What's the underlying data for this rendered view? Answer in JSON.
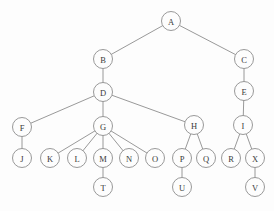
{
  "diagram": {
    "kind": "tree-diagram",
    "title": "",
    "canvas": {
      "width": 274,
      "height": 211
    },
    "style": {
      "background_color": "#fdfdfd",
      "stroke_color": "#8d8d8d",
      "node_fill_color": "#fdfdfd",
      "label_color": "#3a3a3a",
      "node_radius": 9.5,
      "stroke_width": 0.9
    },
    "root": "A",
    "nodes": [
      {
        "id": "A",
        "label": "A",
        "x": 171,
        "y": 21
      },
      {
        "id": "B",
        "label": "B",
        "x": 103,
        "y": 59
      },
      {
        "id": "C",
        "label": "C",
        "x": 244,
        "y": 59
      },
      {
        "id": "D",
        "label": "D",
        "x": 103,
        "y": 92
      },
      {
        "id": "E",
        "label": "E",
        "x": 244,
        "y": 91
      },
      {
        "id": "F",
        "label": "F",
        "x": 22,
        "y": 127
      },
      {
        "id": "G",
        "label": "G",
        "x": 103,
        "y": 126
      },
      {
        "id": "H",
        "label": "H",
        "x": 194,
        "y": 125
      },
      {
        "id": "I",
        "label": "I",
        "x": 243,
        "y": 125
      },
      {
        "id": "J",
        "label": "J",
        "x": 22,
        "y": 158
      },
      {
        "id": "K",
        "label": "K",
        "x": 50,
        "y": 158
      },
      {
        "id": "L",
        "label": "L",
        "x": 77,
        "y": 158
      },
      {
        "id": "M",
        "label": "M",
        "x": 103,
        "y": 158
      },
      {
        "id": "N",
        "label": "N",
        "x": 129,
        "y": 158
      },
      {
        "id": "O",
        "label": "O",
        "x": 155,
        "y": 158
      },
      {
        "id": "P",
        "label": "P",
        "x": 182,
        "y": 158
      },
      {
        "id": "Q",
        "label": "Q",
        "x": 206,
        "y": 158
      },
      {
        "id": "R",
        "label": "R",
        "x": 231,
        "y": 158
      },
      {
        "id": "X",
        "label": "X",
        "x": 255,
        "y": 158
      },
      {
        "id": "T",
        "label": "T",
        "x": 103,
        "y": 187
      },
      {
        "id": "U",
        "label": "U",
        "x": 182,
        "y": 187
      },
      {
        "id": "V",
        "label": "V",
        "x": 255,
        "y": 187
      }
    ],
    "edges": [
      {
        "from": "A",
        "to": "B"
      },
      {
        "from": "A",
        "to": "C"
      },
      {
        "from": "B",
        "to": "D"
      },
      {
        "from": "C",
        "to": "E"
      },
      {
        "from": "D",
        "to": "F"
      },
      {
        "from": "D",
        "to": "G"
      },
      {
        "from": "D",
        "to": "H"
      },
      {
        "from": "E",
        "to": "I"
      },
      {
        "from": "F",
        "to": "J"
      },
      {
        "from": "G",
        "to": "K"
      },
      {
        "from": "G",
        "to": "L"
      },
      {
        "from": "G",
        "to": "M"
      },
      {
        "from": "G",
        "to": "N"
      },
      {
        "from": "G",
        "to": "O"
      },
      {
        "from": "H",
        "to": "P"
      },
      {
        "from": "H",
        "to": "Q"
      },
      {
        "from": "I",
        "to": "R"
      },
      {
        "from": "I",
        "to": "X"
      },
      {
        "from": "M",
        "to": "T"
      },
      {
        "from": "P",
        "to": "U"
      },
      {
        "from": "X",
        "to": "V"
      }
    ]
  }
}
